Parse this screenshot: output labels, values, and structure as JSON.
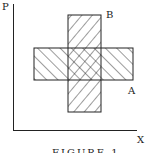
{
  "diagram": {
    "y_axis_label": "P",
    "x_axis_label": "X",
    "rect_a_label": "A",
    "rect_b_label": "B",
    "caption": "FIGURE 1",
    "colors": {
      "stroke": "#222222",
      "background": "#ffffff"
    }
  }
}
